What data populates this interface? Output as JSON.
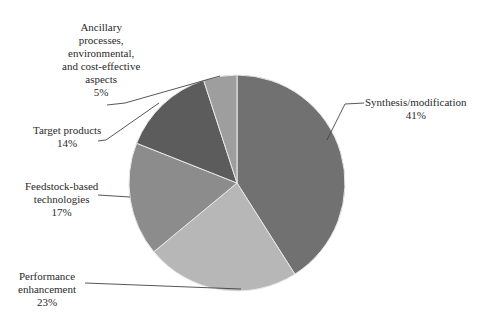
{
  "chart_data": {
    "type": "pie",
    "title": "",
    "center": [
      237,
      183
    ],
    "radius": 108,
    "start_angle_deg": 0,
    "direction": "clockwise",
    "slices": [
      {
        "label": "Synthesis/modification",
        "value": 41,
        "pct": "41%",
        "color": "#717171"
      },
      {
        "label": "Performance enhancement",
        "value": 23,
        "pct": "23%",
        "color": "#b7b7b7"
      },
      {
        "label": "Feedstock-based technologies",
        "value": 17,
        "pct": "17%",
        "color": "#8c8c8c"
      },
      {
        "label": "Target products",
        "value": 14,
        "pct": "14%",
        "color": "#5c5c5c"
      },
      {
        "label": "Ancillary processes, environmental, and cost-effective aspects",
        "value": 5,
        "pct": "5%",
        "color": "#9e9e9e"
      }
    ],
    "legend": "none (leader-line labels)"
  },
  "labels": {
    "synthesis": {
      "lines": [
        "Synthesis/modification"
      ],
      "pct": "41%"
    },
    "performance": {
      "lines": [
        "Performance",
        "enhancement"
      ],
      "pct": "23%"
    },
    "feedstock": {
      "lines": [
        "Feedstock-based",
        "technologies"
      ],
      "pct": "17%"
    },
    "target": {
      "lines": [
        "Target products"
      ],
      "pct": "14%"
    },
    "ancillary": {
      "lines": [
        "Ancillary",
        "processes,",
        "environmental,",
        "and cost-effective",
        "aspects"
      ],
      "pct": "5%"
    }
  }
}
